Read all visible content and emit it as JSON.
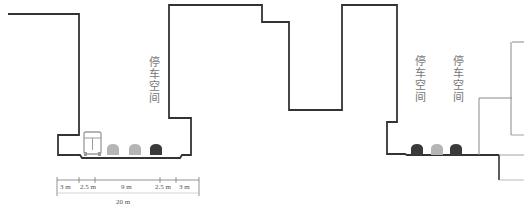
{
  "diagram": {
    "type": "street-cross-section",
    "labels": {
      "parking_left": "停车空间",
      "parking_right_1": "停车空间",
      "parking_right_2": "停车空间"
    },
    "dimensions": {
      "segments": [
        "3 m",
        "2.5 m",
        "9 m",
        "2.5 m",
        "3 m"
      ],
      "total": "20 m"
    },
    "vehicles_left": [
      {
        "kind": "bus",
        "color": "#9a9a9a"
      },
      {
        "kind": "car",
        "color": "#b5b5b5"
      },
      {
        "kind": "car",
        "color": "#b5b5b5"
      },
      {
        "kind": "car",
        "color": "#3a3a3a"
      }
    ],
    "vehicles_right": [
      {
        "kind": "car",
        "color": "#3a3a3a"
      },
      {
        "kind": "car",
        "color": "#b5b5b5"
      },
      {
        "kind": "car",
        "color": "#3a3a3a"
      }
    ],
    "colors": {
      "outline": "#333333",
      "thin_outline": "#8a8a8a",
      "label": "#777777"
    }
  }
}
